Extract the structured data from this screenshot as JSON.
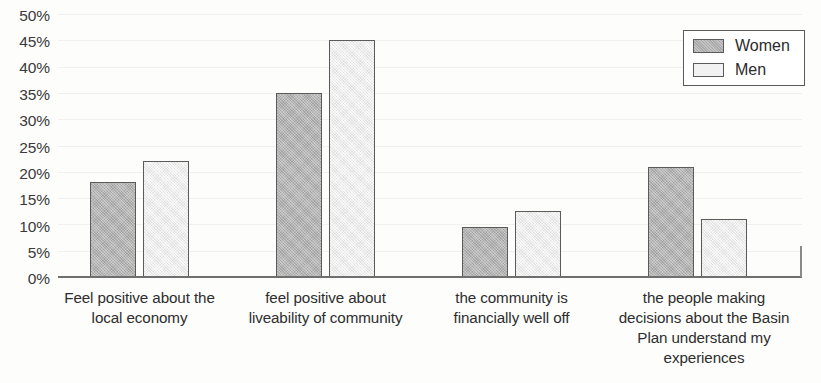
{
  "chart_data": {
    "type": "bar",
    "title": "",
    "subtitle": "",
    "xlabel": "",
    "ylabel": "",
    "ylim": [
      0,
      50
    ],
    "y_tick_step": 5,
    "grid": true,
    "legend_position": "top-right",
    "value_format": "percent",
    "categories": [
      "Feel positive about the local economy",
      "feel positive about liveability of community",
      "the community is financially well off",
      "the people making decisions about the Basin Plan understand my experiences"
    ],
    "series": [
      {
        "name": "Women",
        "color": "#b2b2b2",
        "values": [
          18,
          35,
          9.5,
          21
        ]
      },
      {
        "name": "Men",
        "color": "#efefef",
        "values": [
          22,
          45,
          12.5,
          11
        ]
      }
    ]
  },
  "axis": {
    "y_ticks": [
      "50%",
      "45%",
      "40%",
      "35%",
      "30%",
      "25%",
      "20%",
      "15%",
      "10%",
      "5%",
      "0%"
    ],
    "x_tick_labels": [
      [
        "Feel positive about the",
        "local economy"
      ],
      [
        "feel positive about",
        "liveability of community"
      ],
      [
        "the community is",
        "financially well off"
      ],
      [
        "the people making",
        "decisions about the Basin",
        "Plan understand my",
        "experiences"
      ]
    ]
  },
  "legend": {
    "items": [
      {
        "label": "Women",
        "swatch": "women-swatch"
      },
      {
        "label": "Men",
        "swatch": "men-swatch"
      }
    ]
  },
  "colors": {
    "women_fill": "#b2b2b2",
    "men_fill": "#efefef",
    "bar_border": "#5b5b5b",
    "axis": "#6f6f6f",
    "gridline": "#f1f0ee",
    "text": "#2e2e2e",
    "background": "#fdfdfc"
  }
}
